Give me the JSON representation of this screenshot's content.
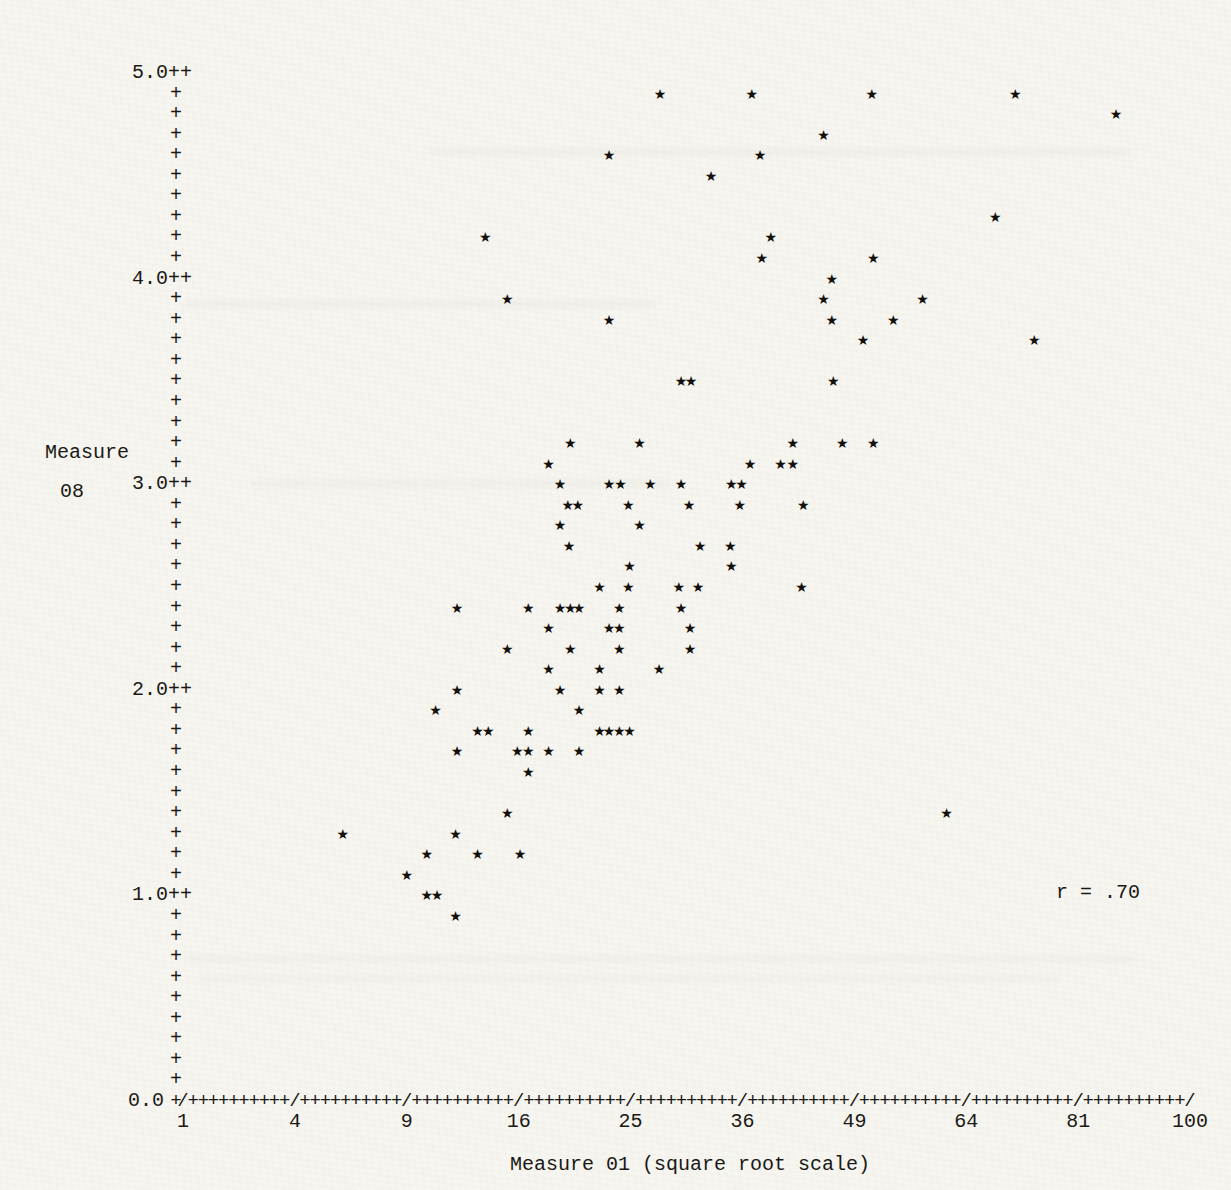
{
  "page": {
    "paper_color": "#f6f5f0",
    "ink_color": "#1b1915"
  },
  "chart_data": {
    "type": "scatter",
    "title": "",
    "xlabel": "Measure 01 (square root scale)",
    "ylabel_lines": [
      "Measure",
      "08"
    ],
    "x_scale": "sqrt",
    "x_ticks": [
      1,
      4,
      9,
      16,
      25,
      36,
      49,
      64,
      81,
      100
    ],
    "y_tick_labels": [
      "5.0",
      "4.0",
      "3.0",
      "2.0",
      "1.0"
    ],
    "origin_label": "0.0",
    "xlim": [
      1,
      100
    ],
    "ylim": [
      0.0,
      5.0
    ],
    "grid": false,
    "annotation": "r = .70",
    "marker": "★",
    "points": [
      [
        27.7,
        4.9
      ],
      [
        37.0,
        4.9
      ],
      [
        51.2,
        4.9
      ],
      [
        71.2,
        4.9
      ],
      [
        87.2,
        4.8
      ],
      [
        45.2,
        4.7
      ],
      [
        23.1,
        4.6
      ],
      [
        37.9,
        4.6
      ],
      [
        32.7,
        4.5
      ],
      [
        68.2,
        4.3
      ],
      [
        13.7,
        4.2
      ],
      [
        39.1,
        4.2
      ],
      [
        38.1,
        4.1
      ],
      [
        51.4,
        4.1
      ],
      [
        46.2,
        4.0
      ],
      [
        15.2,
        3.9
      ],
      [
        45.2,
        3.9
      ],
      [
        57.9,
        3.9
      ],
      [
        23.1,
        3.8
      ],
      [
        46.2,
        3.8
      ],
      [
        54.0,
        3.8
      ],
      [
        50.1,
        3.7
      ],
      [
        74.1,
        3.7
      ],
      [
        29.7,
        3.5
      ],
      [
        30.7,
        3.5
      ],
      [
        46.4,
        3.5
      ],
      [
        19.9,
        3.2
      ],
      [
        25.8,
        3.2
      ],
      [
        41.6,
        3.2
      ],
      [
        47.5,
        3.2
      ],
      [
        51.4,
        3.2
      ],
      [
        18.2,
        3.1
      ],
      [
        36.8,
        3.1
      ],
      [
        40.2,
        3.1
      ],
      [
        41.6,
        3.1
      ],
      [
        19.1,
        3.0
      ],
      [
        23.1,
        3.0
      ],
      [
        24.1,
        3.0
      ],
      [
        26.8,
        3.0
      ],
      [
        29.7,
        3.0
      ],
      [
        34.8,
        3.0
      ],
      [
        35.9,
        3.0
      ],
      [
        19.7,
        2.9
      ],
      [
        20.5,
        2.9
      ],
      [
        24.8,
        2.9
      ],
      [
        30.5,
        2.9
      ],
      [
        35.7,
        2.9
      ],
      [
        42.8,
        2.9
      ],
      [
        19.1,
        2.8
      ],
      [
        25.8,
        2.8
      ],
      [
        19.8,
        2.7
      ],
      [
        31.6,
        2.7
      ],
      [
        34.7,
        2.7
      ],
      [
        24.9,
        2.6
      ],
      [
        34.8,
        2.6
      ],
      [
        22.3,
        2.5
      ],
      [
        24.8,
        2.5
      ],
      [
        29.5,
        2.5
      ],
      [
        31.4,
        2.5
      ],
      [
        42.6,
        2.5
      ],
      [
        11.9,
        2.4
      ],
      [
        16.7,
        2.4
      ],
      [
        19.1,
        2.4
      ],
      [
        19.9,
        2.4
      ],
      [
        20.6,
        2.4
      ],
      [
        24.0,
        2.4
      ],
      [
        29.7,
        2.4
      ],
      [
        18.2,
        2.3
      ],
      [
        23.1,
        2.3
      ],
      [
        24.0,
        2.3
      ],
      [
        30.6,
        2.3
      ],
      [
        15.2,
        2.2
      ],
      [
        19.9,
        2.2
      ],
      [
        24.0,
        2.2
      ],
      [
        30.6,
        2.2
      ],
      [
        18.2,
        2.1
      ],
      [
        22.3,
        2.1
      ],
      [
        27.6,
        2.1
      ],
      [
        11.9,
        2.0
      ],
      [
        19.1,
        2.0
      ],
      [
        22.3,
        2.0
      ],
      [
        24.0,
        2.0
      ],
      [
        10.6,
        1.9
      ],
      [
        20.6,
        1.9
      ],
      [
        13.2,
        1.8
      ],
      [
        13.9,
        1.8
      ],
      [
        16.7,
        1.8
      ],
      [
        22.3,
        1.8
      ],
      [
        23.1,
        1.8
      ],
      [
        24.0,
        1.8
      ],
      [
        24.9,
        1.8
      ],
      [
        11.9,
        1.7
      ],
      [
        15.9,
        1.7
      ],
      [
        16.7,
        1.7
      ],
      [
        18.2,
        1.7
      ],
      [
        20.6,
        1.7
      ],
      [
        16.7,
        1.6
      ],
      [
        15.2,
        1.4
      ],
      [
        61.2,
        1.4
      ],
      [
        5.9,
        1.3
      ],
      [
        11.8,
        1.3
      ],
      [
        10.1,
        1.2
      ],
      [
        13.2,
        1.2
      ],
      [
        16.1,
        1.2
      ],
      [
        9.0,
        1.1
      ],
      [
        10.1,
        1.0
      ],
      [
        10.7,
        1.0
      ],
      [
        11.8,
        0.9
      ]
    ]
  }
}
